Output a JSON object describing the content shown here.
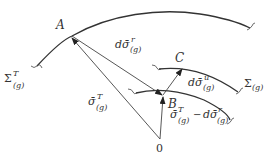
{
  "diagram": {
    "points": {
      "A": "A",
      "B": "B",
      "C": "C",
      "origin": "0"
    },
    "surfaces": {
      "outer": {
        "base": "Σ",
        "sup": "T",
        "sub": "(g)"
      },
      "inner": {
        "base": "Σ",
        "sub": "(g)"
      }
    },
    "vectors": {
      "OA": {
        "base": "σ̄",
        "sup": "T",
        "sub": "(g)"
      },
      "AB": {
        "base": "dσ̄",
        "sup": "r",
        "sub": "(g)"
      },
      "BC": {
        "base": "dσ̄",
        "sup": "u",
        "sub": "(g)"
      },
      "OB": {
        "base": "σ̄",
        "sup": "T",
        "sub": "(g)",
        "minus": "−",
        "base2": "dσ̄",
        "sup2": "r",
        "sub2": "(g)"
      }
    }
  }
}
